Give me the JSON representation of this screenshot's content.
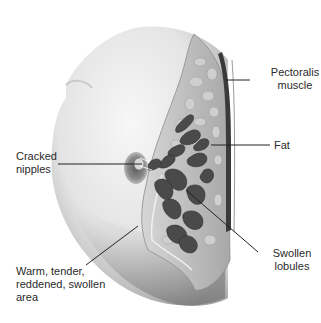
{
  "diagram": {
    "labels": {
      "pectoralis": "Pectoralis\nmuscle",
      "fat": "Fat",
      "cracked_nipples": "Cracked\nnipples",
      "warm_area": "Warm, tender,\nreddened, swollen\narea",
      "swollen_lobules": "Swollen\nlobules"
    },
    "leader_lines": [
      {
        "label": "pectoralis",
        "x1": 226,
        "y1": 80,
        "x2": 250,
        "y2": 80
      },
      {
        "label": "fat",
        "x1": 211,
        "y1": 145,
        "x2": 270,
        "y2": 145
      },
      {
        "label": "cracked_nipples",
        "x1": 58,
        "y1": 164,
        "x2": 142,
        "y2": 164
      },
      {
        "label": "warm_area",
        "x1": 86,
        "y1": 265,
        "x2": 138,
        "y2": 226
      },
      {
        "label": "swollen_lobules",
        "x1": 186,
        "y1": 190,
        "x2": 258,
        "y2": 252
      }
    ],
    "colors": {
      "background": "#ffffff",
      "skin_light": "#f2f2f2",
      "skin_shadow": "#9a9a9a",
      "tissue": "#bdbdbd",
      "lobule": "#4a4a4a",
      "muscle": "#3a3a3a",
      "line": "#222222",
      "text": "#2a2a2a"
    }
  }
}
